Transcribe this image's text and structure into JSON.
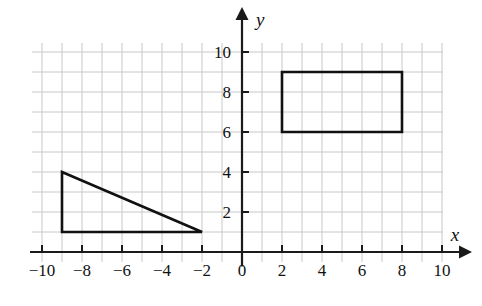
{
  "figure": {
    "background_color": "#ffffff",
    "grid_color": "#c8c8c8",
    "axis_color": "#1a1a1a",
    "shape_color": "#111111"
  },
  "chart_data": {
    "type": "scatter",
    "title": "",
    "xlabel": "x",
    "ylabel": "y",
    "xlim": [
      -10.6,
      10.4
    ],
    "ylim": [
      -0.7,
      10.6
    ],
    "grid": true,
    "grid_step": 1,
    "legend": "none",
    "x_ticks": [
      -10,
      -8,
      -6,
      -4,
      -2,
      0,
      2,
      4,
      6,
      8,
      10
    ],
    "x_tick_labels": [
      "−10",
      "−8",
      "−6",
      "−4",
      "−2",
      "0",
      "2",
      "4",
      "6",
      "8",
      "10"
    ],
    "y_ticks": [
      2,
      4,
      6,
      8,
      10
    ],
    "y_tick_labels": [
      "2",
      "4",
      "6",
      "8",
      "10"
    ],
    "x_minor_ticks": [
      -9,
      -7,
      -5,
      -3,
      -1,
      1,
      3,
      5,
      7,
      9
    ],
    "y_minor_ticks": [
      1,
      3,
      5,
      7,
      9
    ],
    "shapes": [
      {
        "name": "triangle",
        "type": "polygon",
        "closed": true,
        "fill": "none",
        "stroke": "#111111",
        "vertices": [
          {
            "x": -9,
            "y": 4
          },
          {
            "x": -9,
            "y": 1
          },
          {
            "x": -2,
            "y": 1
          }
        ]
      },
      {
        "name": "rectangle",
        "type": "polygon",
        "closed": true,
        "fill": "none",
        "stroke": "#111111",
        "vertices": [
          {
            "x": 2,
            "y": 9
          },
          {
            "x": 8,
            "y": 9
          },
          {
            "x": 8,
            "y": 6
          },
          {
            "x": 2,
            "y": 6
          }
        ]
      }
    ],
    "axes": {
      "x_axis_label": "x",
      "y_axis_label": "y",
      "x_axis_arrow": true,
      "y_axis_arrow": true,
      "origin_label": "0"
    }
  }
}
